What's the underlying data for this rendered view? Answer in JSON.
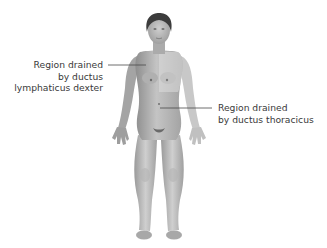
{
  "figure": {
    "style": "grayscale-illustration"
  },
  "labels": {
    "left": {
      "lines": [
        "Region drained",
        "by ductus",
        "lymphaticus dexter"
      ]
    },
    "right": {
      "lines": [
        "Region drained",
        "by ductus thoracicus"
      ]
    }
  },
  "colors": {
    "text": "#3a3a3a",
    "leader_line": "#4a4a4a",
    "skin_dark": "#9a9a9a",
    "skin_light": "#d6d6d6",
    "hair": "#3c3c3c",
    "background": "#ffffff"
  }
}
